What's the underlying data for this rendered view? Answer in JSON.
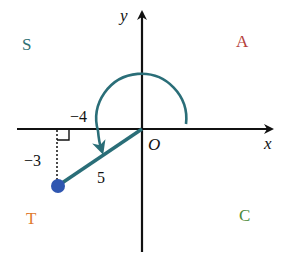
{
  "diagram": {
    "axes": {
      "x_label": "x",
      "y_label": "y",
      "origin_label": "O"
    },
    "quadrants": [
      {
        "name": "S",
        "position": "top-left",
        "color": "#2e6f73"
      },
      {
        "name": "A",
        "position": "top-right",
        "color": "#b5403a"
      },
      {
        "name": "T",
        "position": "bottom-left",
        "color": "#e07a2e"
      },
      {
        "name": "C",
        "position": "bottom-right",
        "color": "#4c8a3a"
      }
    ],
    "point": {
      "x": -4,
      "y": -3,
      "color": "#2f56b0"
    },
    "labels": {
      "x_leg": "−4",
      "y_leg": "−3",
      "hypotenuse": "5"
    },
    "colors": {
      "terminal_side": "#2a6e78",
      "arc": "#2a6e78",
      "axes": "#111111"
    }
  }
}
